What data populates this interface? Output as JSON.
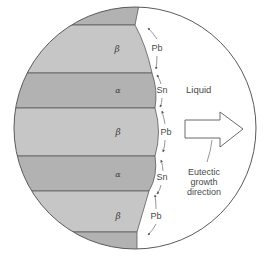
{
  "diagram": {
    "colors": {
      "beta_phase": "#c6c6c6",
      "alpha_phase": "#b2b2b2",
      "outline": "#5a5a5a",
      "liquid": "#ffffff",
      "text": "#4a4a4a"
    },
    "lamellae": [
      {
        "phase": "beta",
        "label": "β"
      },
      {
        "phase": "alpha",
        "label": "α"
      },
      {
        "phase": "beta",
        "label": "β"
      },
      {
        "phase": "alpha",
        "label": "α"
      },
      {
        "phase": "beta",
        "label": "β"
      }
    ],
    "diffusion_labels": [
      {
        "element": "Pb"
      },
      {
        "element": "Sn"
      },
      {
        "element": "Pb"
      },
      {
        "element": "Sn"
      },
      {
        "element": "Pb"
      }
    ],
    "liquid_label": "Liquid",
    "growth_arrow": {
      "caption_lines": [
        "Eutectic",
        "growth",
        "direction"
      ]
    }
  }
}
